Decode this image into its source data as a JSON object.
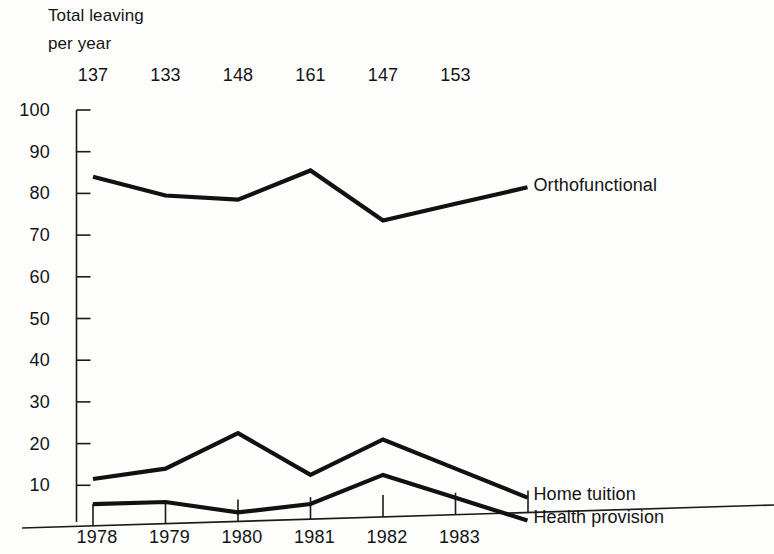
{
  "header": {
    "line1": "Total leaving",
    "line2": "per year"
  },
  "chart_data": {
    "type": "line",
    "title": "Total leaving per year",
    "xlabel": "",
    "ylabel": "",
    "categories": [
      "1978",
      "1979",
      "1980",
      "1981",
      "1982",
      "1983"
    ],
    "x": [
      1978,
      1979,
      1980,
      1981,
      1982,
      1983
    ],
    "ylim": [
      0,
      100
    ],
    "xlim": [
      1977.7,
      1984.3
    ],
    "ytick_labels": [
      "10",
      "20",
      "30",
      "40",
      "50",
      "60",
      "70",
      "80",
      "90",
      "100"
    ],
    "yticks": [
      10,
      20,
      30,
      40,
      50,
      60,
      70,
      80,
      90,
      100
    ],
    "xtick_labels": [
      "1978",
      "1979",
      "1980",
      "1981",
      "1982",
      "1983"
    ],
    "grid": false,
    "legend_position": "right-inline",
    "annotations": {
      "totals_label": "Total leaving per year",
      "totals": [
        137,
        133,
        148,
        161,
        147,
        153
      ]
    },
    "series": [
      {
        "name": "Orthofunctional",
        "values": [
          84,
          79.5,
          78.5,
          85.5,
          73.5,
          77.5
        ]
      },
      {
        "name": "Home tuition",
        "values": [
          11.5,
          14,
          22.5,
          12.5,
          21,
          14
        ]
      },
      {
        "name": "Health provision",
        "values": [
          5.5,
          6,
          3.5,
          5.5,
          12.5,
          7
        ]
      }
    ]
  },
  "series_labels": {
    "orthofunctional": "Orthofunctional",
    "home_tuition": "Home tuition",
    "health_provision": "Health provision"
  }
}
